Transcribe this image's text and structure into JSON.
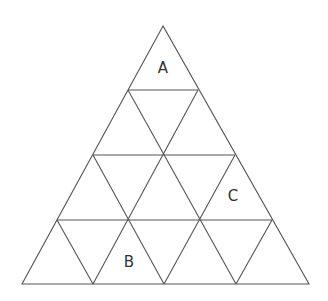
{
  "diagram": {
    "type": "triangular-grid",
    "rows": 4,
    "line_color": "#555555",
    "background": "#ffffff",
    "labels": [
      {
        "text": "A",
        "x": 163,
        "y": 68
      },
      {
        "text": "C",
        "x": 233,
        "y": 196
      },
      {
        "text": "B",
        "x": 129,
        "y": 262
      }
    ]
  }
}
